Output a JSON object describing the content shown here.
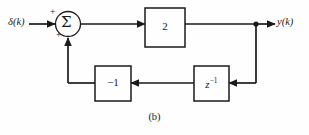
{
  "figure": {
    "caption": "(b)",
    "type": "discrete-time block diagram",
    "line_color": "#1a1a1a",
    "background_color": "#fefefe"
  },
  "signals": {
    "input_label": "δ(k)",
    "output_label": "y(k)"
  },
  "summing_junction": {
    "symbol": "Σ",
    "input_sign": "+",
    "feedback_sign": "+"
  },
  "blocks": {
    "forward_gain": {
      "label": "2",
      "name": "gain-block"
    },
    "feedback_gain": {
      "label": "−1",
      "name": "feedback-gain-block"
    },
    "delay": {
      "base": "z",
      "exponent": "−1",
      "label": "z−1",
      "name": "unit-delay-block"
    }
  },
  "nodes": {
    "output_tap": "output-tap-node"
  }
}
